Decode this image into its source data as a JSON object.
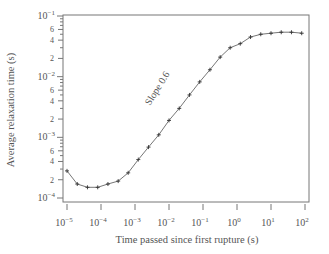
{
  "chart_data": {
    "type": "line",
    "title": "",
    "xlabel": "Time passed since first rupture (s)",
    "ylabel": "Average relaxation time (s)",
    "xscale": "log",
    "yscale": "log",
    "xlim": [
      1e-05,
      100
    ],
    "ylim": [
      0.0001,
      0.1
    ],
    "grid": false,
    "legend": null,
    "x_ticks": [
      "10^-5",
      "10^-4",
      "10^-3",
      "10^-2",
      "10^-1",
      "10^0",
      "10^1",
      "10^2"
    ],
    "y_ticks": [
      "10^-4",
      "10^-3",
      "10^-2",
      "10^-1"
    ],
    "y_minor_labels": [
      "2",
      "4",
      "6"
    ],
    "annotations": [
      {
        "text": "Slope 0.6",
        "x": 0.004,
        "y": 0.0035,
        "rotation": -58
      }
    ],
    "series": [
      {
        "name": "average relaxation time",
        "marker": "+",
        "x": [
          1e-05,
          2e-05,
          4e-05,
          8e-05,
          0.00016,
          0.00032,
          0.00063,
          0.00125,
          0.0025,
          0.005,
          0.01,
          0.02,
          0.04,
          0.08,
          0.16,
          0.32,
          0.63,
          1.25,
          2.5,
          5,
          10,
          20,
          40,
          80
        ],
        "values": [
          0.00028,
          0.00017,
          0.00015,
          0.00015,
          0.00017,
          0.00019,
          0.00026,
          0.00043,
          0.00069,
          0.0011,
          0.0019,
          0.003,
          0.005,
          0.0082,
          0.013,
          0.021,
          0.03,
          0.035,
          0.045,
          0.05,
          0.052,
          0.054,
          0.054,
          0.052
        ]
      }
    ]
  },
  "labels": {
    "xlabel": "Time passed since first rupture (s)",
    "ylabel": "Average relaxation time (s)",
    "annotation": "Slope 0.6"
  },
  "style": {
    "axis_color": "#777777",
    "line_color": "#666666",
    "marker_color": "#333333"
  }
}
